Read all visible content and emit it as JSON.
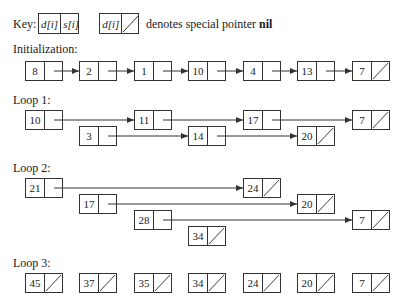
{
  "key": {
    "label": "Key:",
    "cell_d": "d[i]",
    "cell_s": "s[i]",
    "nil_desc": "denotes special pointer",
    "nil_word": "nil"
  },
  "sections": [
    {
      "label": "Initialization:",
      "nodes": [
        "8",
        "2",
        "1",
        "10",
        "4",
        "13",
        "7"
      ]
    },
    {
      "label": "Loop 1:",
      "nodes": [
        "10",
        "11",
        "17",
        "7",
        "3",
        "14",
        "20"
      ]
    },
    {
      "label": "Loop 2:",
      "nodes": [
        "21",
        "24",
        "17",
        "20",
        "28",
        "7",
        "34"
      ]
    },
    {
      "label": "Loop 3:",
      "nodes": [
        "45",
        "37",
        "35",
        "34",
        "24",
        "20",
        "7"
      ]
    }
  ],
  "colors": {
    "stroke": "#333333",
    "text": "#1a1a1a",
    "background": "#ffffff"
  }
}
